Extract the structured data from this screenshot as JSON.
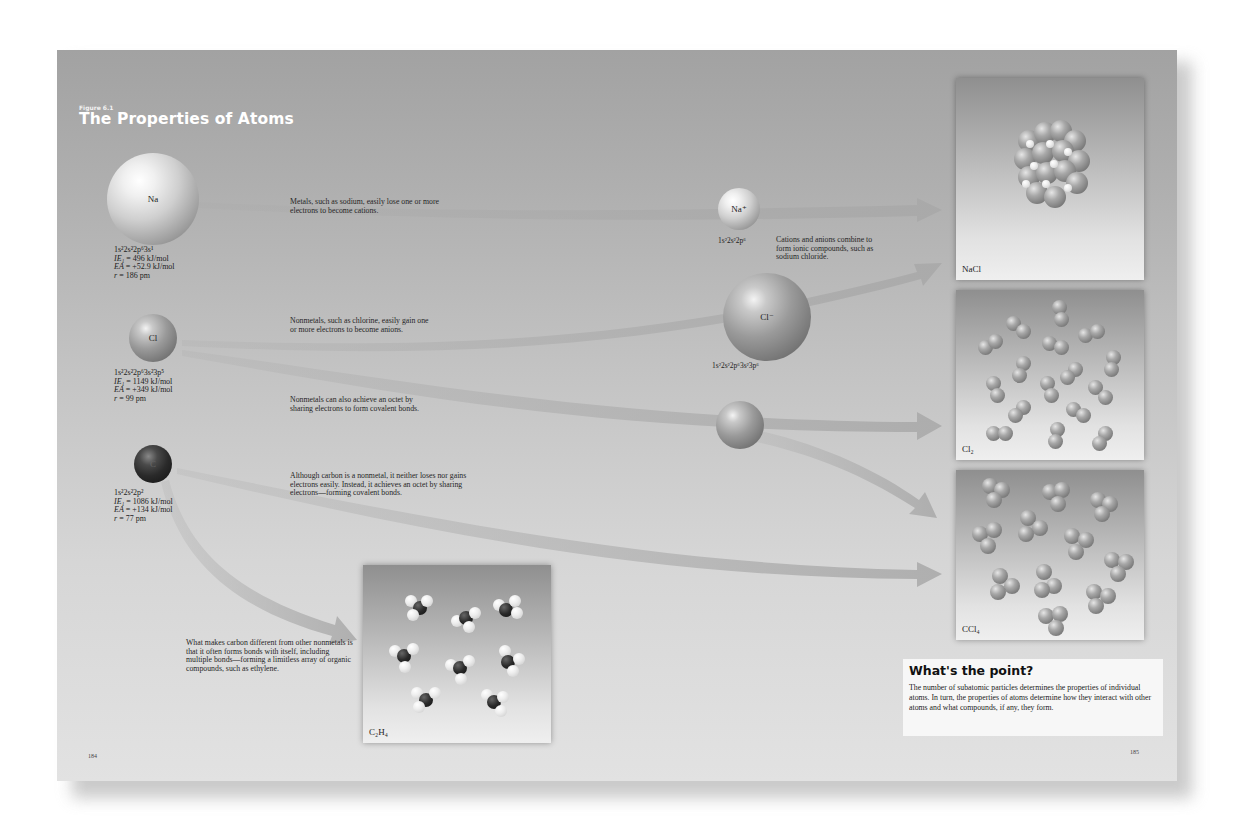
{
  "figure": {
    "label": "Figure 6.1",
    "title": "The Properties of Atoms"
  },
  "atoms": [
    {
      "symbol": "Na",
      "config": "1s²2s²2p⁶3s¹",
      "ie_label": "IE₁",
      "ie_value": " = 496 kJ/mol",
      "ea_label": "EA",
      "ea_value": " = +52.9 kJ/mol",
      "r_label": "r",
      "r_value": " = 186 pm",
      "description": "Metals, such as sodium, easily lose one or more electrons to become cations."
    },
    {
      "symbol": "Cl",
      "config": "1s²2s²2p⁶3s²3p⁵",
      "ie_label": "IE₁",
      "ie_value": " = 1149 kJ/mol",
      "ea_label": "EA",
      "ea_value": " = +349 kJ/mol",
      "r_label": "r",
      "r_value": " = 99 pm",
      "description": "Nonmetals, such as chlorine, easily gain one or more electrons to become anions.",
      "description2": "Nonmetals can also achieve an octet by sharing electrons to form covalent bonds."
    },
    {
      "symbol": "C",
      "config": "1s²2s²2p²",
      "ie_label": "IE₁",
      "ie_value": " = 1086 kJ/mol",
      "ea_label": "EA",
      "ea_value": " = +134 kJ/mol",
      "r_label": "r",
      "r_value": " = 77 pm",
      "description": "Although carbon is a nonmetal, it neither loses nor gains electrons easily. Instead, it achieves an octet by sharing electrons—forming covalent bonds.",
      "description2": "What makes carbon different from other nonmetals is that it often forms bonds with itself, including multiple bonds—forming a limitless array of organic compounds, such as ethylene."
    }
  ],
  "ions": [
    {
      "symbol": "Na⁺",
      "config": "1s²2s²2p⁶"
    },
    {
      "symbol": "Cl⁻",
      "config": "1s²2s²2p⁶3s²3p⁶"
    }
  ],
  "ionic_note": "Cations and anions combine to form ionic compounds, such as sodium chloride.",
  "compounds": [
    {
      "name": "NaCl"
    },
    {
      "name": "Cl₂"
    },
    {
      "name": "CCl₄"
    },
    {
      "name": "C₂H₄"
    }
  ],
  "point": {
    "title": "What's the point?",
    "text": "The number of subatomic particles determines the properties of individual atoms. In turn, the properties of atoms determine how they interact with other atoms and what compounds, if any, they form."
  },
  "pages": {
    "left": "184",
    "right": "185"
  },
  "colors": {
    "page_top": "#a2a2a2",
    "page_bottom": "#e2e2e2",
    "arrow": "#b4b4b4",
    "title": "#ffffff"
  }
}
